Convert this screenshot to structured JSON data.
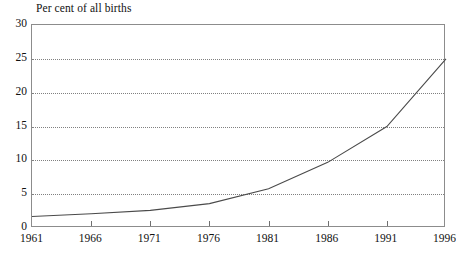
{
  "chart_data": {
    "type": "line",
    "title": "Per cent of all births",
    "xlabel": "",
    "ylabel": "",
    "x": [
      1961,
      1966,
      1971,
      1976,
      1981,
      1986,
      1991,
      1996
    ],
    "categories": [
      "1961",
      "1966",
      "1971",
      "1976",
      "1981",
      "1986",
      "1991",
      "1996"
    ],
    "values": [
      1.7,
      2.1,
      2.6,
      3.6,
      5.8,
      9.7,
      15.0,
      25.0
    ],
    "series": [
      {
        "name": "Per cent of all births",
        "values": [
          1.7,
          2.1,
          2.6,
          3.6,
          5.8,
          9.7,
          15.0,
          25.0
        ]
      }
    ],
    "xlim": [
      1961,
      1996
    ],
    "ylim": [
      0,
      30
    ],
    "ytick_labels": [
      "0",
      "5",
      "10",
      "15",
      "20",
      "25",
      "30"
    ],
    "ytick_values": [
      0,
      5,
      10,
      15,
      20,
      25,
      30
    ],
    "xtick_labels": [
      "1961",
      "1966",
      "1971",
      "1976",
      "1981",
      "1986",
      "1991",
      "1996"
    ],
    "grid": "horizontal-dotted",
    "legend": "none",
    "line_color": "#4a4a4a",
    "grid_color": "#808080",
    "frame_color": "#8c8c8c",
    "background_color": "#ffffff"
  }
}
